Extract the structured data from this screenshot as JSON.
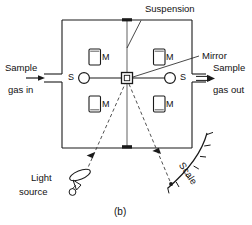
{
  "figure": {
    "caption": "(b)",
    "type": "magnetic-susceptibility-gas-analyzer-schematic"
  },
  "labels": {
    "suspension": "Suspension",
    "mirror": "Mirror",
    "scale": "Scale",
    "sample_gas_in_line1": "Sample",
    "sample_gas_in_line2": "gas in",
    "sample_gas_out_line1": "Sample",
    "sample_gas_out_line2": "gas out",
    "light_source_line1": "Light",
    "light_source_line2": "source"
  },
  "components": {
    "magnets": [
      {
        "id": "magnet-top-left",
        "label": "M"
      },
      {
        "id": "magnet-top-right",
        "label": "M"
      },
      {
        "id": "magnet-bottom-left",
        "label": "M"
      },
      {
        "id": "magnet-bottom-right",
        "label": "M"
      }
    ],
    "spheres": [
      {
        "id": "sphere-left",
        "label": "S"
      },
      {
        "id": "sphere-right",
        "label": "S"
      }
    ]
  },
  "colors": {
    "stroke": "#1a1a1a",
    "text": "#111111",
    "background": "#ffffff",
    "fill": "#ffffff"
  }
}
